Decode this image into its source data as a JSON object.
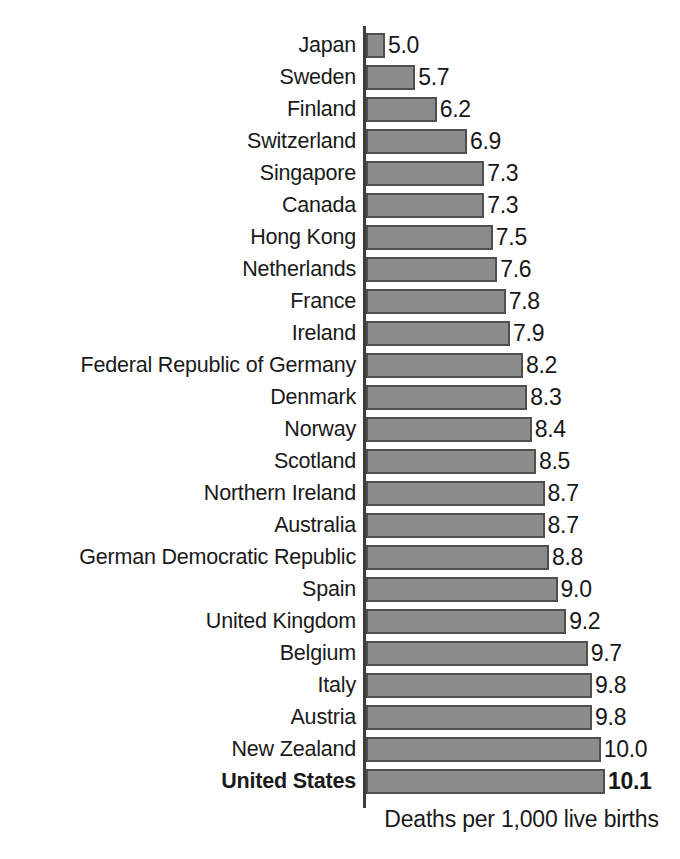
{
  "chart_data": {
    "type": "bar",
    "orientation": "horizontal",
    "title": "",
    "subtitle": "",
    "xlabel": "Deaths per 1,000 live births",
    "ylabel": "",
    "grid": false,
    "legend": "none",
    "value_format": "one-decimal",
    "highlight_category": "United States",
    "xlim": [
      0,
      10.1
    ],
    "axis_note": "bars drawn from a left baseline; bar lengths scale with value",
    "categories": [
      "Japan",
      "Sweden",
      "Finland",
      "Switzerland",
      "Singapore",
      "Canada",
      "Hong Kong",
      "Netherlands",
      "France",
      "Ireland",
      "Federal Republic of Germany",
      "Denmark",
      "Norway",
      "Scotland",
      "Northern Ireland",
      "Australia",
      "German Democratic Republic",
      "Spain",
      "United Kingdom",
      "Belgium",
      "Italy",
      "Austria",
      "New Zealand",
      "United States"
    ],
    "values": [
      5.0,
      5.7,
      6.2,
      6.9,
      7.3,
      7.3,
      7.5,
      7.6,
      7.8,
      7.9,
      8.2,
      8.3,
      8.4,
      8.5,
      8.7,
      8.7,
      8.8,
      9.0,
      9.2,
      9.7,
      9.8,
      9.8,
      10.0,
      10.1
    ],
    "value_labels": [
      "5.0",
      "5.7",
      "6.2",
      "6.9",
      "7.3",
      "7.3",
      "7.5",
      "7.6",
      "7.8",
      "7.9",
      "8.2",
      "8.3",
      "8.4",
      "8.5",
      "8.7",
      "8.7",
      "8.8",
      "9.0",
      "9.2",
      "9.7",
      "9.8",
      "9.8",
      "10.0",
      "10.1"
    ],
    "colors": {
      "bar_fill": "#8c8c8c",
      "bar_border": "#4f4f4f",
      "axis_line": "#3d3d3d",
      "text": "#1a1a1a",
      "background": "#ffffff"
    }
  }
}
